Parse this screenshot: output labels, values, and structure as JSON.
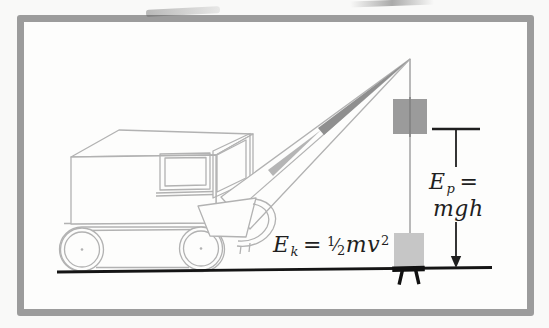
{
  "figure": {
    "kind": "physics-textbook-illustration",
    "colors": {
      "frame_border": "#9c9c9c",
      "panel_background": "#fdfdfc",
      "line_art": "#b2b2b2",
      "ink": "#1f1f1f",
      "raised_weight": "#9b9b9b",
      "ground_weight": "#c6c6c6",
      "cable": "#a8a8a8"
    },
    "formulas": {
      "kinetic": {
        "base": "E",
        "sub": "k",
        "eq": "=",
        "num": "1",
        "slash": "⁄",
        "den": "2",
        "body": "mv",
        "exp": "2"
      },
      "potential": {
        "base": "E",
        "sub": "p",
        "eq": "=",
        "line2": "mgh"
      }
    }
  }
}
